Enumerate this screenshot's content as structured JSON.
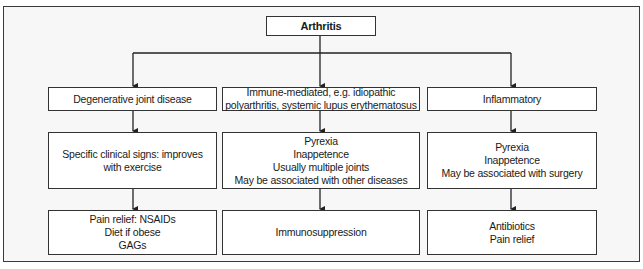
{
  "diagram": {
    "root": {
      "label": "Arthritis"
    },
    "columns": [
      {
        "category": [
          "Degenerative joint disease"
        ],
        "signs": [
          "Specific clinical signs: improves",
          "with exercise"
        ],
        "treatment": [
          "Pain relief: NSAIDs",
          "Diet if obese",
          "GAGs"
        ]
      },
      {
        "category": [
          "Immune-mediated, e.g. idiopathic",
          "polyarthritis, systemic lupus erythematosus"
        ],
        "signs": [
          "Pyrexia",
          "Inappetence",
          "Usually multiple joints",
          "May be associated with other diseases"
        ],
        "treatment": [
          "Immunosuppression"
        ]
      },
      {
        "category": [
          "Inflammatory"
        ],
        "signs": [
          "Pyrexia",
          "Inappetence",
          "May be associated with surgery"
        ],
        "treatment": [
          "Antibiotics",
          "Pain relief"
        ]
      }
    ]
  },
  "colors": {
    "background": "#f7f7f7",
    "box_fill": "#ffffff",
    "stroke": "#333333"
  }
}
